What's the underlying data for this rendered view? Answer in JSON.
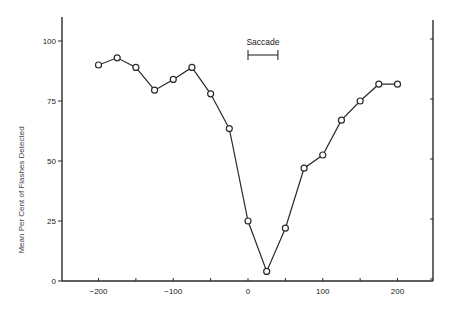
{
  "chart_data": {
    "type": "line",
    "title": "",
    "xlabel": "",
    "ylabel": "Mean Per Cent of Flashes Detected",
    "x": [
      -200,
      -175,
      -150,
      -125,
      -100,
      -75,
      -50,
      -25,
      0,
      25,
      50,
      75,
      100,
      125,
      150,
      175,
      200
    ],
    "series": [
      {
        "name": "Flashes detected",
        "values": [
          90,
          93,
          89,
          79.5,
          84,
          89,
          78,
          63.5,
          25,
          4,
          22,
          47,
          52.5,
          67,
          75,
          82,
          82
        ],
        "marker": "open-circle"
      }
    ],
    "xlim": [
      -250,
      250
    ],
    "ylim": [
      0,
      110
    ],
    "xticks": [
      -200,
      -150,
      -100,
      -50,
      0,
      50,
      100,
      150,
      200
    ],
    "xtick_labels": [
      "-200",
      "",
      "-100",
      "",
      "0",
      "",
      "100",
      "",
      "200"
    ],
    "yticks": [
      0,
      25,
      50,
      75,
      100
    ],
    "ytick_labels": [
      "0",
      "25",
      "50",
      "75",
      "100"
    ],
    "right_axis_ticks": [
      0,
      25,
      50,
      75,
      100
    ],
    "grid": false,
    "legend": null,
    "annotations": [
      {
        "text": "Saccade",
        "type": "interval-bar",
        "x_start": 0,
        "x_end": 40,
        "y": 97
      }
    ]
  }
}
